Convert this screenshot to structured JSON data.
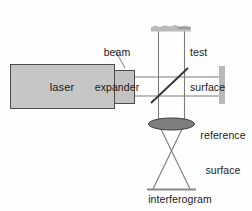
{
  "figure": {
    "background_color": "#fefefe",
    "line_color": "#6b6b6b",
    "dark_line_color": "#3a3a3a",
    "text_color": "#1a1a1a"
  },
  "labels": {
    "laser": "laser",
    "beam_expander": "beam\nexpander",
    "beam_expander_line1": "beam",
    "beam_expander_line2": "expander",
    "test_surface": "test\nsurface",
    "test_surface_line1": "test",
    "test_surface_line2": "surface",
    "reference_surface": "reference\nsurface",
    "reference_surface_line1": "reference",
    "reference_surface_line2": "surface",
    "interferogram": "interferogram"
  },
  "components": {
    "laser": {
      "name": "laser",
      "shape": "rectangle",
      "fill": "#c6c6c6",
      "stroke": "#4d4d4d",
      "x": 10,
      "y": 64,
      "width": 104,
      "height": 44
    },
    "beam_expander": {
      "name": "beam-expander",
      "shape": "rectangle",
      "fill": "#c2c2c2",
      "stroke": "#4d4d4d",
      "x": 107,
      "y": 70,
      "width": 27,
      "height": 33
    },
    "beam_splitter": {
      "name": "beam-splitter",
      "shape": "diagonal-line",
      "stroke": "#333333",
      "angle_degrees": 45,
      "x1": 152,
      "y1": 102,
      "x2": 187,
      "y2": 69
    },
    "test_surface": {
      "name": "test-surface",
      "shape": "horizontal-bar-irregular-top",
      "fill": "#b9b9b9",
      "x": 151,
      "y": 25,
      "width": 40,
      "height": 7
    },
    "reference_surface": {
      "name": "reference-surface",
      "shape": "vertical-bar",
      "fill": "#b9b9b9",
      "x": 219,
      "y": 66,
      "width": 6,
      "height": 38
    },
    "lens": {
      "name": "imaging-lens",
      "shape": "ellipse",
      "fill": "#7e7e7e",
      "stroke": "#3a3a3a",
      "cx": 171,
      "cy": 124,
      "rx": 23,
      "ry": 6
    },
    "interferogram_plane": {
      "name": "interferogram-plane",
      "shape": "horizontal-line",
      "stroke": "#8a8a8a",
      "x1": 148,
      "y1": 190,
      "x2": 195,
      "y2": 190
    }
  },
  "beams": {
    "horizontal_upper": {
      "x1": 134,
      "y1": 77,
      "x2": 219,
      "y2": 77
    },
    "horizontal_lower": {
      "x1": 134,
      "y1": 96,
      "x2": 219,
      "y2": 96
    },
    "vertical_left": {
      "x1": 158,
      "y1": 31,
      "x2": 158,
      "y2": 124
    },
    "vertical_right": {
      "x1": 184,
      "y1": 31,
      "x2": 184,
      "y2": 124
    },
    "converge_left": {
      "x1": 158,
      "y1": 124,
      "x2": 190,
      "y2": 189
    },
    "converge_right": {
      "x1": 184,
      "y1": 124,
      "x2": 152,
      "y2": 189
    }
  },
  "leaders": {
    "beam_expander_leader": {
      "x1": 116,
      "y1": 52,
      "x2": 125,
      "y2": 68
    },
    "test_surface_leader": {
      "x1": 176,
      "y1": 28,
      "x2": 189,
      "y2": 28
    }
  }
}
